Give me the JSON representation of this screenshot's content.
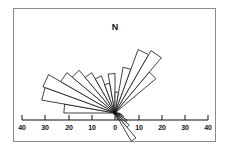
{
  "figure": {
    "type": "rose-diagram",
    "north_label": "N",
    "frame": {
      "x": 13,
      "y": 8,
      "width": 203,
      "height": 134,
      "border_color": "#8a8a8a"
    },
    "center": {
      "x": 115,
      "y": 113
    },
    "background_color": "#ffffff",
    "petal_fill": "#ffffff",
    "petal_stroke": "#111111"
  },
  "axis": {
    "label_left_40": "40",
    "label_left_30": "30",
    "label_left_20": "20",
    "label_left_10": "10",
    "label_zero": "0",
    "label_right_10": "10",
    "label_right_20": "20",
    "label_right_30": "30",
    "label_right_40": "40",
    "ticks": [
      {
        "label": "40",
        "x": 22,
        "value": -40
      },
      {
        "label": "30",
        "x": 45,
        "value": -30
      },
      {
        "label": "20",
        "x": 69,
        "value": -20
      },
      {
        "label": "10",
        "x": 92,
        "value": -10
      },
      {
        "label": "0",
        "x": 115,
        "value": 0
      },
      {
        "label": "10",
        "x": 139,
        "value": 10
      },
      {
        "label": "20",
        "x": 162,
        "value": 20
      },
      {
        "label": "30",
        "x": 185,
        "value": 30
      },
      {
        "label": "40",
        "x": 208,
        "value": 40
      }
    ],
    "bar_y": 120,
    "bar_x_start": 22,
    "bar_x_end": 208,
    "label_y": 124,
    "tick_height": 5,
    "units_per_pixel": 1.72
  },
  "chart_data": {
    "type": "bar",
    "title": "",
    "subtitle": "",
    "xlabel": "",
    "ylabel": "",
    "grid": false,
    "legend": "none",
    "plot_style": "rose-diagram",
    "angle_units": "degrees-azimuth",
    "radial_axis_range": [
      0,
      40
    ],
    "radial_tick_values": [
      0,
      10,
      20,
      30,
      40
    ],
    "petal_width_degrees": 10,
    "categories": [
      "275",
      "285",
      "295",
      "305",
      "315",
      "325",
      "335",
      "345",
      "355",
      "5",
      "15",
      "25",
      "35",
      "45",
      "95",
      "105",
      "115",
      "125",
      "135",
      "145",
      "155"
    ],
    "values": [
      22,
      32,
      33,
      27,
      24,
      20,
      17,
      13,
      17,
      9,
      20,
      29,
      31,
      23,
      2,
      3,
      4,
      6,
      8,
      14,
      3
    ],
    "series": [
      {
        "name": "frequency",
        "points": [
          {
            "azimuth": 275,
            "length": 22
          },
          {
            "azimuth": 285,
            "length": 32
          },
          {
            "azimuth": 295,
            "length": 33
          },
          {
            "azimuth": 305,
            "length": 27
          },
          {
            "azimuth": 315,
            "length": 24
          },
          {
            "azimuth": 325,
            "length": 20
          },
          {
            "azimuth": 335,
            "length": 17
          },
          {
            "azimuth": 345,
            "length": 13
          },
          {
            "azimuth": 355,
            "length": 17
          },
          {
            "azimuth": 5,
            "length": 9
          },
          {
            "azimuth": 15,
            "length": 20
          },
          {
            "azimuth": 25,
            "length": 29
          },
          {
            "azimuth": 35,
            "length": 31
          },
          {
            "azimuth": 45,
            "length": 23
          },
          {
            "azimuth": 95,
            "length": 2
          },
          {
            "azimuth": 105,
            "length": 3
          },
          {
            "azimuth": 115,
            "length": 4
          },
          {
            "azimuth": 125,
            "length": 6
          },
          {
            "azimuth": 135,
            "length": 8
          },
          {
            "azimuth": 145,
            "length": 14
          },
          {
            "azimuth": 155,
            "length": 3
          }
        ]
      }
    ]
  }
}
